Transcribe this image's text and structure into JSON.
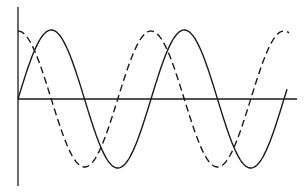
{
  "figure": {
    "title": "",
    "colors": {
      "background": "#ffffff",
      "ink": "#1a1a1a"
    },
    "axes": {
      "origin": {
        "x": 18,
        "y": 99
      },
      "vertical_axis": {
        "x": 18,
        "y_top": 7,
        "y_bottom": 186
      },
      "horizontal_axis": {
        "y": 99,
        "x_start": 18,
        "x_end": 297
      }
    },
    "waves": [
      {
        "name": "solid-wave",
        "style": "solid",
        "function": "sine",
        "amplitude_px": 69,
        "period_px": 133,
        "phase": 0,
        "x_start": 18,
        "x_end": 287
      },
      {
        "name": "dashed-wave",
        "style": "dashed",
        "function": "cosine",
        "amplitude_px": 68,
        "period_px": 133,
        "phase": 0,
        "x_start": 18,
        "x_end": 289
      }
    ]
  }
}
